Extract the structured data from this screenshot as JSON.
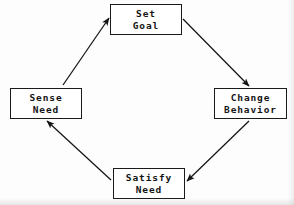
{
  "diagram": {
    "type": "cycle-flow-diagram",
    "direction": "clockwise",
    "stroke_color": "#1a1a1a",
    "fill_color": "#ffffff",
    "background_color": "#fdfdfd",
    "nodes": [
      {
        "id": "set-goal",
        "position": "top",
        "line1": "Set",
        "line2": "Goal"
      },
      {
        "id": "change-behavior",
        "position": "right",
        "line1": "Change",
        "line2": "Behavior"
      },
      {
        "id": "satisfy-need",
        "position": "bottom",
        "line1": "Satisfy",
        "line2": "Need"
      },
      {
        "id": "sense-need",
        "position": "left",
        "line1": "Sense",
        "line2": "Need"
      }
    ],
    "edges": [
      {
        "id": "edge-sense-to-goal",
        "from": "sense-need",
        "to": "set-goal",
        "label": ""
      },
      {
        "id": "edge-goal-to-change",
        "from": "set-goal",
        "to": "change-behavior",
        "label": ""
      },
      {
        "id": "edge-change-to-satisfy",
        "from": "change-behavior",
        "to": "satisfy-need",
        "label": ""
      },
      {
        "id": "edge-satisfy-to-sense",
        "from": "satisfy-need",
        "to": "sense-need",
        "label": ""
      }
    ]
  }
}
